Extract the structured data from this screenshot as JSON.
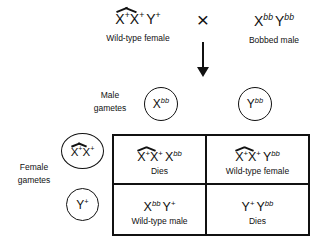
{
  "colors": {
    "ink": "#111111",
    "background": "#ffffff"
  },
  "parents": {
    "female": {
      "genotype": [
        {
          "hat": [
            {
              "b": "X",
              "s": "+"
            },
            {
              "b": "X",
              "s": "+"
            }
          ]
        },
        {
          "b": "Y",
          "s": "+"
        }
      ],
      "label": "Wild-type female"
    },
    "cross_symbol": "×",
    "male": {
      "genotype": [
        {
          "b": "X",
          "s": "bb"
        },
        {
          "b": "Y",
          "s": "bb"
        }
      ],
      "label": "Bobbed male"
    }
  },
  "male_gametes": {
    "label": "Male\ngametes",
    "items": [
      {
        "genotype": [
          {
            "b": "X",
            "s": "bb"
          }
        ]
      },
      {
        "genotype": [
          {
            "b": "Y",
            "s": "bb"
          }
        ]
      }
    ]
  },
  "female_gametes": {
    "label": "Female\ngametes",
    "items": [
      {
        "genotype": [
          {
            "hat": [
              {
                "b": "X",
                "s": "+"
              },
              {
                "b": "X",
                "s": "+"
              }
            ]
          }
        ]
      },
      {
        "genotype": [
          {
            "b": "Y",
            "s": "+"
          }
        ]
      }
    ]
  },
  "punnett": {
    "cells": [
      {
        "genotype": [
          {
            "hat": [
              {
                "b": "X",
                "s": "+"
              },
              {
                "b": "X",
                "s": "+"
              }
            ]
          },
          {
            "b": "X",
            "s": "bb"
          }
        ],
        "phenotype": "Dies"
      },
      {
        "genotype": [
          {
            "hat": [
              {
                "b": "X",
                "s": "+"
              },
              {
                "b": "X",
                "s": "+"
              }
            ]
          },
          {
            "b": "Y",
            "s": "bb"
          }
        ],
        "phenotype": "Wild-type female"
      },
      {
        "genotype": [
          {
            "b": "X",
            "s": "bb"
          },
          {
            "b": "Y",
            "s": "+"
          }
        ],
        "phenotype": "Wild-type male"
      },
      {
        "genotype": [
          {
            "b": "Y",
            "s": "+"
          },
          {
            "b": "Y",
            "s": "bb"
          }
        ],
        "phenotype": "Dies"
      }
    ]
  }
}
